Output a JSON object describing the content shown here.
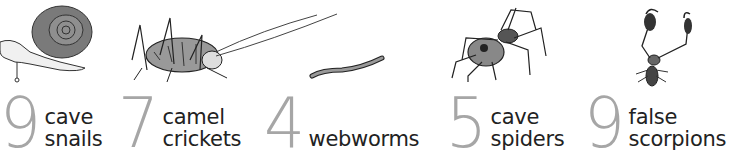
{
  "items": [
    {
      "id": "cave-snails",
      "count": "9",
      "line1": "cave",
      "line2": "snails",
      "icon": "snail-icon"
    },
    {
      "id": "camel-crickets",
      "count": "7",
      "line1": "camel",
      "line2": "crickets",
      "icon": "cricket-icon"
    },
    {
      "id": "webworms",
      "count": "4",
      "line1": "",
      "line2": "webworms",
      "icon": "worm-icon"
    },
    {
      "id": "cave-spiders",
      "count": "5",
      "line1": "cave",
      "line2": "spiders",
      "icon": "spider-icon"
    },
    {
      "id": "false-scorpions",
      "count": "9",
      "line1": "false",
      "line2": "scorpions",
      "icon": "pseudoscorpion-icon"
    }
  ],
  "colors": {
    "numeral": "#a6a6a6",
    "text": "#222222",
    "background": "#ffffff"
  }
}
